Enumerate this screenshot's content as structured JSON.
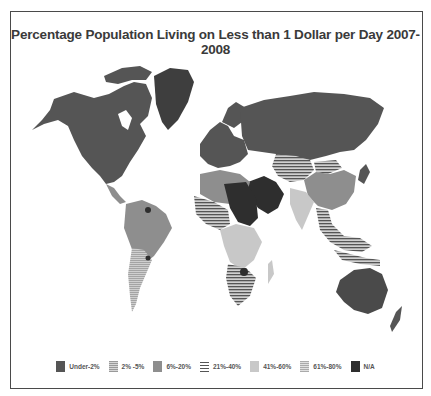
{
  "title": "Percentage Population Living on Less than 1 Dollar per Day 2007-2008",
  "colors": {
    "under2": "#555555",
    "p2_5": "#b8b8b8",
    "p6_20": "#8e8e8e",
    "p21_40": "#6a6a6a",
    "p41_60": "#c8c8c8",
    "p61_80": "#bdbdbd",
    "na": "#2e2e2e",
    "frame": "#4a4a4a",
    "ocean": "#ffffff"
  },
  "legend": {
    "items": [
      {
        "label": "Under-2%",
        "pattern": "solid-dark"
      },
      {
        "label": "2% -5%",
        "pattern": "hatched-light"
      },
      {
        "label": "6%-20%",
        "pattern": "solid-medium"
      },
      {
        "label": "21%-40%",
        "pattern": "horizontal-stripes"
      },
      {
        "label": "41%-60%",
        "pattern": "solid-light"
      },
      {
        "label": "61%-80%",
        "pattern": "fine-hatched-light"
      },
      {
        "label": "N/A",
        "pattern": "solid-black"
      }
    ]
  },
  "map": {
    "projection": "world",
    "regions": [
      {
        "name": "North America",
        "category": "Under-2%"
      },
      {
        "name": "Greenland",
        "category": "Under-2%"
      },
      {
        "name": "Europe",
        "category": "Under-2%"
      },
      {
        "name": "Russia",
        "category": "Under-2%"
      },
      {
        "name": "Australia",
        "category": "Under-2%"
      },
      {
        "name": "South America (most)",
        "category": "6%-20%"
      },
      {
        "name": "Argentina/Chile",
        "category": "2% -5%"
      },
      {
        "name": "North Africa",
        "category": "6%-20%"
      },
      {
        "name": "Arabian Peninsula / Sahara",
        "category": "N/A"
      },
      {
        "name": "West Africa",
        "category": "21%-40%"
      },
      {
        "name": "Southern Africa",
        "category": "21%-40%"
      },
      {
        "name": "Central Asia",
        "category": "21%-40%"
      },
      {
        "name": "China",
        "category": "6%-20%"
      },
      {
        "name": "India",
        "category": "41%-60%"
      },
      {
        "name": "Southeast Asia",
        "category": "21%-40%"
      }
    ]
  }
}
